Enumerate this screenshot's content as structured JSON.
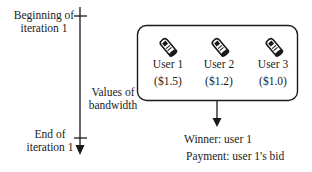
{
  "timeline": {
    "start_label_line1": "Beginning of",
    "start_label_line2": "iteration 1",
    "end_label_line1": "End of",
    "end_label_line2": "iteration 1"
  },
  "box": {
    "side_label_line1": "Values of",
    "side_label_line2": "bandwidth",
    "users": [
      {
        "icon": "mobile-phone-icon",
        "name": "User 1",
        "value": "($1.5)"
      },
      {
        "icon": "mobile-phone-icon",
        "name": "User 2",
        "value": "($1.2)"
      },
      {
        "icon": "mobile-phone-icon",
        "name": "User 3",
        "value": "($1.0)"
      }
    ]
  },
  "result": {
    "winner": "Winner: user 1",
    "payment": "Payment: user 1's bid"
  },
  "colors": {
    "stroke": "#1a1a1a",
    "background": "#ffffff"
  }
}
